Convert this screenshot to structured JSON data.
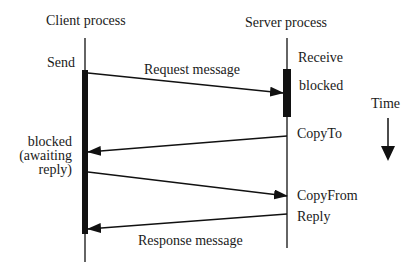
{
  "diagram": {
    "lanes": {
      "client": {
        "title": "Client  process"
      },
      "server": {
        "title": "Server  process"
      }
    },
    "client_labels": {
      "send": "Send",
      "blocked_line1": "blocked",
      "blocked_line2": "(awaiting",
      "blocked_line3": "reply)"
    },
    "server_labels": {
      "receive": "Receive",
      "blocked": "blocked",
      "copy_to": "CopyTo",
      "copy_from": "CopyFrom",
      "reply": "Reply"
    },
    "messages": {
      "request": "Request message",
      "response": "Response message"
    },
    "time": {
      "label": "Time"
    },
    "colors": {
      "ink": "#111111",
      "background": "#ffffff"
    }
  }
}
